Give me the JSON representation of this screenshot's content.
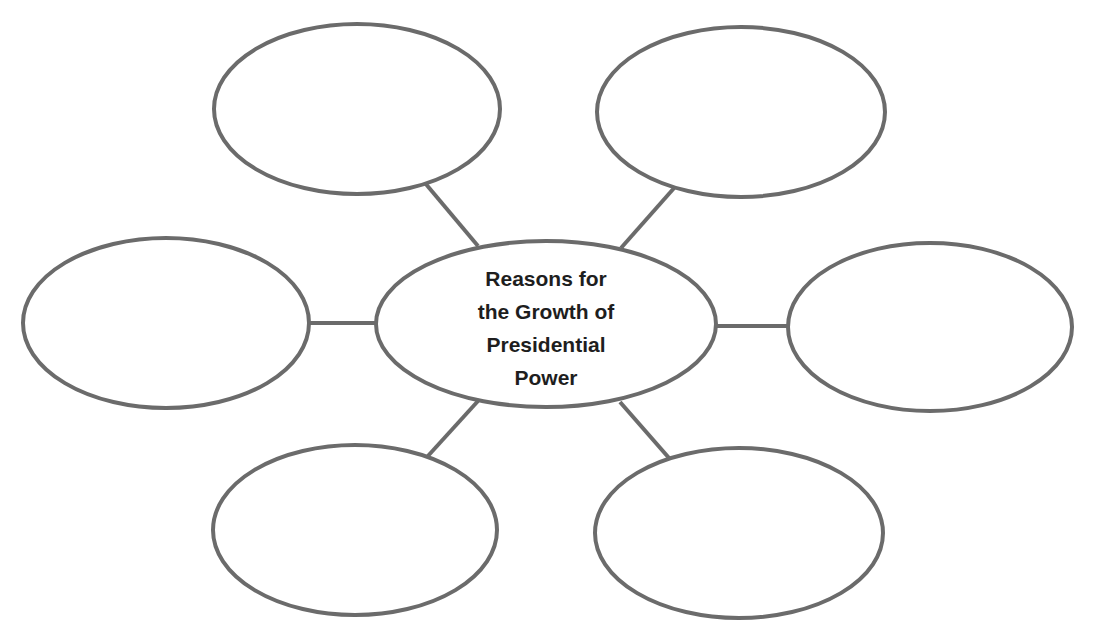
{
  "diagram": {
    "type": "concept-web",
    "center": {
      "lines": [
        "Reasons for",
        "the Growth of",
        "Presidential",
        "Power"
      ],
      "title": "Reasons for the Growth of Presidential Power"
    },
    "outer_bubbles": [
      {
        "position": "top-left",
        "text": ""
      },
      {
        "position": "top-right",
        "text": ""
      },
      {
        "position": "middle-left",
        "text": ""
      },
      {
        "position": "middle-right",
        "text": ""
      },
      {
        "position": "bottom-left",
        "text": ""
      },
      {
        "position": "bottom-right",
        "text": ""
      }
    ],
    "colors": {
      "stroke": "#6b6b6b",
      "text": "#1e1e1e",
      "background": "#ffffff"
    }
  }
}
